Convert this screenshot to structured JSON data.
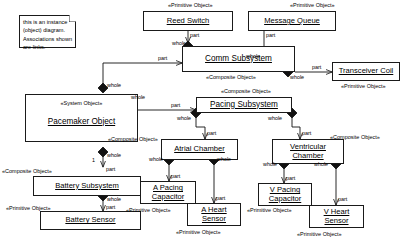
{
  "diagram": {
    "kind": "uml-object-diagram",
    "note": {
      "text": "this is an instance\n(object) diagram.\nAssociations shown\nare links."
    },
    "stereotypes": {
      "primitive": "«Primitive Object»",
      "composite": "«Composite Object»",
      "system": "«System Object»"
    },
    "role_labels": {
      "whole": "whole",
      "part": "part",
      "one": "1"
    },
    "nodes": [
      {
        "id": "reed_switch",
        "label": "Reed Switch",
        "stereotype": "«Primitive Object»"
      },
      {
        "id": "message_queue",
        "label": "Message Queue",
        "stereotype": "«Primitive Object»"
      },
      {
        "id": "transceiver_coil",
        "label": "Transceiver Coil",
        "stereotype": "«Primitive Object»"
      },
      {
        "id": "comm_subsystem",
        "label": "Comm Subsystem",
        "stereotype": "«Composite Object»"
      },
      {
        "id": "pacemaker_object",
        "label": "Pacemaker Object",
        "stereotype": "«System Object»"
      },
      {
        "id": "pacing_subsystem",
        "label": "Pacing Subsystem",
        "stereotype": "«Composite Object»"
      },
      {
        "id": "atrial_chamber",
        "label": "Atrial Chamber",
        "stereotype": "«Composite Object»"
      },
      {
        "id": "ventricular_chamber",
        "label": "Ventricular\nChamber",
        "stereotype": "«Composite Object»"
      },
      {
        "id": "battery_subsystem",
        "label": "Battery Subsystem",
        "stereotype": "«Composite Object»"
      },
      {
        "id": "battery_sensor",
        "label": "Battery Sensor",
        "stereotype": "«Primitive Object»"
      },
      {
        "id": "a_pacing_capacitor",
        "label": "A Pacing\nCapacitor",
        "stereotype": "«Primitive Object»"
      },
      {
        "id": "a_heart_sensor",
        "label": "A Heart\nSensor",
        "stereotype": "«Primitive Object»"
      },
      {
        "id": "v_pacing_capacitor",
        "label": "V Pacing\nCapacitor",
        "stereotype": "«Primitive Object»"
      },
      {
        "id": "v_heart_sensor",
        "label": "V Heart\nSensor",
        "stereotype": "«Primitive Object»"
      }
    ],
    "links": [
      {
        "from": "comm_subsystem",
        "to": "reed_switch",
        "whole": "whole",
        "part": "part"
      },
      {
        "from": "comm_subsystem",
        "to": "message_queue",
        "whole": "whole",
        "part": "part"
      },
      {
        "from": "comm_subsystem",
        "to": "transceiver_coil",
        "whole": "whole",
        "part": "part"
      },
      {
        "from": "pacemaker_object",
        "to": "comm_subsystem",
        "whole": "whole",
        "part": "part"
      },
      {
        "from": "pacemaker_object",
        "to": "pacing_subsystem",
        "whole": "whole",
        "part": "part"
      },
      {
        "from": "pacemaker_object",
        "to": "battery_subsystem",
        "whole": "whole",
        "part": "part",
        "multiplicity": "1"
      },
      {
        "from": "battery_subsystem",
        "to": "battery_sensor",
        "whole": "whole",
        "part": "part"
      },
      {
        "from": "pacing_subsystem",
        "to": "atrial_chamber",
        "whole": "whole",
        "part": "part"
      },
      {
        "from": "pacing_subsystem",
        "to": "ventricular_chamber",
        "whole": "whole",
        "part": "part"
      },
      {
        "from": "atrial_chamber",
        "to": "a_pacing_capacitor",
        "whole": "whole",
        "part": "part"
      },
      {
        "from": "atrial_chamber",
        "to": "a_heart_sensor",
        "whole": "whole",
        "part": "part"
      },
      {
        "from": "ventricular_chamber",
        "to": "v_pacing_capacitor",
        "whole": "whole",
        "part": "part"
      },
      {
        "from": "ventricular_chamber",
        "to": "v_heart_sensor",
        "whole": "whole",
        "part": "part"
      }
    ]
  }
}
